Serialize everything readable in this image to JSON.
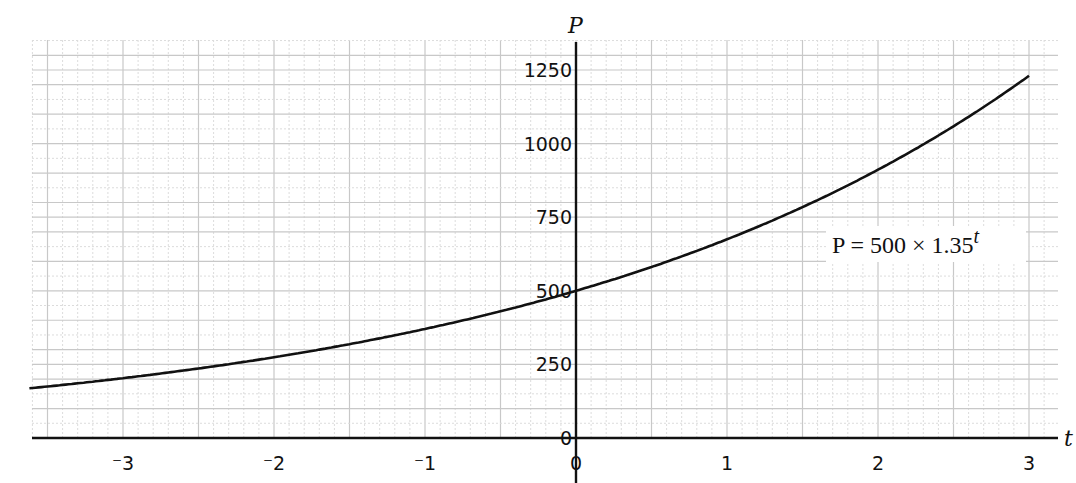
{
  "chart_data": {
    "type": "line",
    "title": "",
    "xlabel": "t",
    "ylabel": "P",
    "xlim": [
      -3.6,
      3.2
    ],
    "ylim": [
      0,
      1330
    ],
    "x_ticks": [
      -3,
      -2,
      -1,
      0,
      1,
      2,
      3
    ],
    "x_tick_labels": [
      "⁻3",
      "⁻2",
      "⁻1",
      "0",
      "1",
      "2",
      "3"
    ],
    "y_ticks": [
      0,
      250,
      500,
      750,
      1000,
      1250
    ],
    "y_tick_labels": [
      "0",
      "250",
      "500",
      "750",
      "1000",
      "1250"
    ],
    "grid": true,
    "series": [
      {
        "name": "P = 500 × 1.35^t",
        "formula": {
          "a": 500,
          "b": 1.35
        },
        "x": [
          -3.6,
          -3,
          -2.5,
          -2,
          -1.5,
          -1,
          -0.5,
          0,
          0.5,
          1,
          1.5,
          2,
          2.5,
          3
        ],
        "values": [
          170.3,
          203.2,
          236.1,
          274.3,
          318.8,
          370.4,
          430.3,
          500,
          581.0,
          675.0,
          784.3,
          911.3,
          1058.8,
          1230.2
        ]
      }
    ],
    "annotations": [
      {
        "text_main": "P = 500 × 1.35",
        "text_sup": "t",
        "x": 1.7,
        "y": 650
      }
    ]
  },
  "labels": {
    "x_axis": "t",
    "y_axis": "P",
    "formula_main": "P = 500 × 1.35",
    "formula_exp": "t"
  }
}
